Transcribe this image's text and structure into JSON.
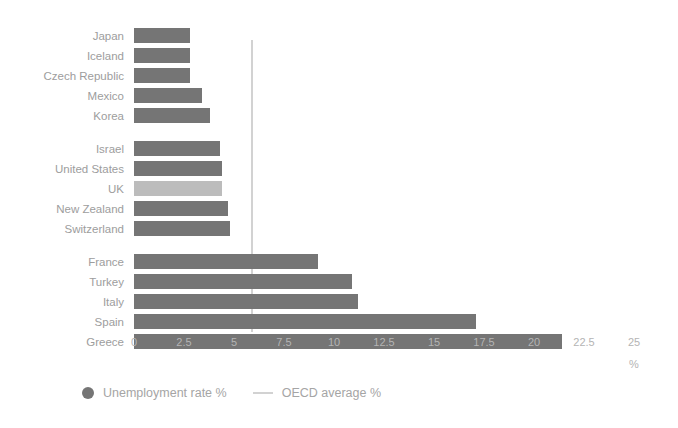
{
  "chart_data": {
    "type": "bar",
    "orientation": "horizontal",
    "title": "",
    "xlabel": "%",
    "ylabel": "",
    "xlim": [
      0,
      25
    ],
    "xticks": [
      "0",
      "2.5",
      "5",
      "7.5",
      "10",
      "12.5",
      "15",
      "17.5",
      "20",
      "22.5",
      "25"
    ],
    "xtick_values": [
      0,
      2.5,
      5,
      7.5,
      10,
      12.5,
      15,
      17.5,
      20,
      22.5,
      25
    ],
    "grid": false,
    "legend_position": "bottom-left",
    "categories": [
      "Japan",
      "Iceland",
      "Czech Republic",
      "Mexico",
      "Korea",
      "Israel",
      "United States",
      "UK",
      "New Zealand",
      "Switzerland",
      "France",
      "Turkey",
      "Italy",
      "Spain",
      "Greece"
    ],
    "values": [
      2.8,
      2.8,
      2.8,
      3.4,
      3.8,
      4.3,
      4.4,
      4.4,
      4.7,
      4.8,
      9.2,
      10.9,
      11.2,
      17.1,
      21.4
    ],
    "groups": [
      {
        "name": "lowest",
        "categories": [
          "Japan",
          "Iceland",
          "Czech Republic",
          "Mexico",
          "Korea"
        ]
      },
      {
        "name": "middle",
        "categories": [
          "Israel",
          "United States",
          "UK",
          "New Zealand",
          "Switzerland"
        ]
      },
      {
        "name": "highest",
        "categories": [
          "France",
          "Turkey",
          "Italy",
          "Spain",
          "Greece"
        ]
      }
    ],
    "highlighted_category": "UK",
    "reference_line": {
      "label": "OECD average %",
      "value": 5.85
    },
    "series": [
      {
        "name": "Unemployment rate %",
        "values": [
          2.8,
          2.8,
          2.8,
          3.4,
          3.8,
          4.3,
          4.4,
          4.4,
          4.7,
          4.8,
          9.2,
          10.9,
          11.2,
          17.1,
          21.4
        ]
      }
    ],
    "colors": {
      "bar": "#757575",
      "bar_highlight": "#bcbcbc",
      "reference_line": "#d2d2d2",
      "text": "#9d9d9d",
      "background": "#ffffff"
    }
  },
  "legend": {
    "items": [
      {
        "label": "Unemployment rate %",
        "marker": "dot-marker"
      },
      {
        "label": "OECD average %",
        "marker": "line-marker"
      }
    ]
  },
  "axis": {
    "unit_label": "%"
  }
}
